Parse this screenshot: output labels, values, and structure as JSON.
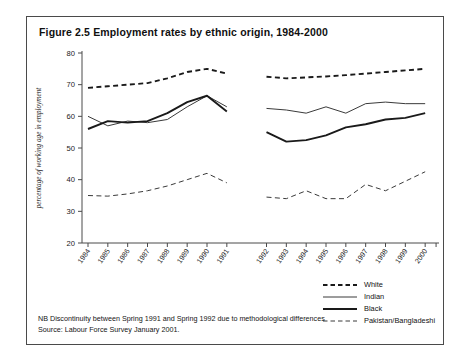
{
  "figure": {
    "title": "Figure 2.5 Employment rates by ethnic origin, 1984-2000"
  },
  "footnotes": {
    "note": "NB Discontinuity between Spring 1991 and Spring 1992 due to methodological differences",
    "source": "Source: Labour Force Survey January 2001."
  },
  "legend": {
    "items": [
      {
        "label": "White",
        "style": "dashed",
        "width": 1.9,
        "color": "#1a1a1a"
      },
      {
        "label": "Indian",
        "style": "solid",
        "width": 1.0,
        "color": "#3a3a3a"
      },
      {
        "label": "Black",
        "style": "solid",
        "width": 1.9,
        "color": "#1a1a1a"
      },
      {
        "label": "Pakistan/Bangladeshi",
        "style": "dashed",
        "width": 1.0,
        "color": "#3a3a3a"
      }
    ]
  },
  "chart_data": {
    "type": "line",
    "title": "Figure 2.5 Employment rates by ethnic origin, 1984-2000",
    "xlabel": "",
    "ylabel": "percentage of working age in employment",
    "ylim": [
      20,
      80
    ],
    "yticks": [
      20,
      30,
      40,
      50,
      60,
      70,
      80
    ],
    "grid": false,
    "legend_position": "bottom-right",
    "note": "Series are broken between 1991 and 1992 (discontinuity)",
    "x": [
      1984,
      1985,
      1986,
      1987,
      1988,
      1989,
      1990,
      1991,
      1992,
      1993,
      1994,
      1995,
      1996,
      1997,
      1998,
      1999,
      2000
    ],
    "x_segments": [
      [
        1984,
        1985,
        1986,
        1987,
        1988,
        1989,
        1990,
        1991
      ],
      [
        1992,
        1993,
        1994,
        1995,
        1996,
        1997,
        1998,
        1999,
        2000
      ]
    ],
    "series": [
      {
        "name": "White",
        "style": "dashed",
        "width": 1.9,
        "color": "#1a1a1a",
        "segments": [
          [
            69.0,
            69.5,
            70.0,
            70.5,
            72.0,
            74.0,
            75.0,
            73.5
          ],
          [
            72.5,
            72.0,
            72.3,
            72.6,
            73.0,
            73.5,
            74.0,
            74.5,
            75.0
          ]
        ]
      },
      {
        "name": "Indian",
        "style": "solid",
        "width": 1.0,
        "color": "#3a3a3a",
        "segments": [
          [
            60.0,
            57.0,
            58.5,
            58.0,
            59.0,
            63.0,
            66.5,
            63.0
          ],
          [
            62.5,
            62.0,
            61.0,
            63.0,
            61.0,
            64.0,
            64.5,
            64.0,
            64.0
          ]
        ]
      },
      {
        "name": "Black",
        "style": "solid",
        "width": 1.9,
        "color": "#1a1a1a",
        "segments": [
          [
            56.0,
            58.5,
            58.0,
            58.5,
            61.0,
            64.5,
            66.5,
            61.5
          ],
          [
            55.0,
            52.0,
            52.5,
            54.0,
            56.5,
            57.5,
            59.0,
            59.5,
            61.0
          ]
        ]
      },
      {
        "name": "Pakistan/Bangladeshi",
        "style": "dashed",
        "width": 1.0,
        "color": "#3a3a3a",
        "segments": [
          [
            35.0,
            34.8,
            35.5,
            36.5,
            38.0,
            40.0,
            42.0,
            39.0
          ],
          [
            34.5,
            34.0,
            36.5,
            34.0,
            34.0,
            38.5,
            36.5,
            39.5,
            42.5
          ]
        ]
      }
    ]
  }
}
